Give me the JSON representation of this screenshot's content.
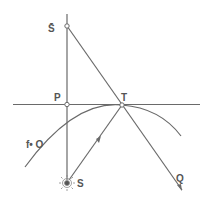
{
  "diagram": {
    "labels": {
      "s_bar": "S̄",
      "p": "P",
      "t": "T",
      "s": "S",
      "q": "Q",
      "o": "f• O"
    },
    "colors": {
      "line": "#6a6a6a",
      "text": "#555555",
      "background": "#ffffff"
    }
  }
}
